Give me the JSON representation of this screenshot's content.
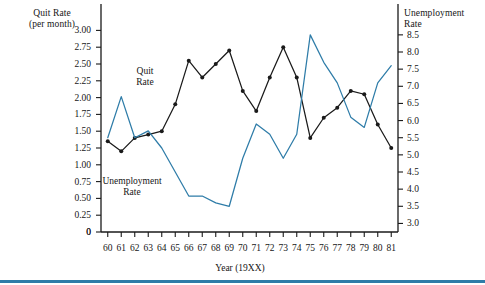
{
  "figure": {
    "left_axis_title": "Quit Rate\n(per month)",
    "right_axis_title": "Unemployment\nRate",
    "x_axis_title": "Year (19XX)",
    "quit_series_label": "Quit\nRate",
    "unemployment_series_label": "Unemployment\nRate",
    "zero_label": "0",
    "accent_color": "#2e7ca8",
    "quit_line_color": "#1a1a1a",
    "unemployment_line_color": "#2e7ca8",
    "bottom_rule_color": "#2e7ca8"
  },
  "chart_data": {
    "type": "line",
    "title": "",
    "xlabel": "Year (19XX)",
    "ylabel": "Quit Rate (per month)",
    "y2label": "Unemployment Rate",
    "grid": false,
    "legend": "inline-annotations",
    "x": [
      60,
      61,
      62,
      63,
      64,
      65,
      66,
      67,
      68,
      69,
      70,
      71,
      72,
      73,
      74,
      75,
      76,
      77,
      78,
      79,
      80,
      81
    ],
    "xticklabels": [
      "60",
      "61",
      "62",
      "63",
      "64",
      "65",
      "66",
      "67",
      "68",
      "69",
      "70",
      "71",
      "72",
      "73",
      "74",
      "75",
      "76",
      "77",
      "78",
      "79",
      "80",
      "81"
    ],
    "ylim": [
      0,
      3.125
    ],
    "yticks": [
      0,
      0.25,
      0.5,
      0.75,
      1.0,
      1.25,
      1.5,
      1.75,
      2.0,
      2.25,
      2.5,
      2.75,
      3.0
    ],
    "yticklabels": [
      "0",
      "0.25",
      "0.50",
      "0.75",
      "1.00",
      "1.25",
      "1.50",
      "1.75",
      "2.00",
      "2.25",
      "2.50",
      "2.75",
      "3.00"
    ],
    "y2lim": [
      2.75,
      8.875
    ],
    "y2ticks": [
      3.0,
      3.5,
      4.0,
      4.5,
      5.0,
      5.5,
      6.0,
      6.5,
      7.0,
      7.5,
      8.0,
      8.5
    ],
    "y2ticklabels": [
      "3.0",
      "3.5",
      "4.0",
      "4.5",
      "5.0",
      "5.5",
      "6.0",
      "6.5",
      "7.0",
      "7.5",
      "8.0",
      "8.5"
    ],
    "series": [
      {
        "name": "Quit Rate",
        "axis": "left",
        "color": "#1a1a1a",
        "markers": true,
        "values": [
          1.35,
          1.2,
          1.4,
          1.45,
          1.5,
          1.9,
          2.55,
          2.3,
          2.5,
          2.7,
          2.1,
          1.8,
          2.3,
          2.75,
          2.3,
          1.4,
          1.7,
          1.85,
          2.1,
          2.05,
          1.6,
          1.25
        ]
      },
      {
        "name": "Unemployment Rate",
        "axis": "right",
        "color": "#2e7ca8",
        "markers": false,
        "values": [
          5.5,
          6.7,
          5.5,
          5.7,
          5.2,
          4.5,
          3.8,
          3.8,
          3.6,
          3.5,
          4.9,
          5.9,
          5.6,
          4.9,
          5.6,
          8.5,
          7.7,
          7.1,
          6.1,
          5.8,
          7.1,
          7.6
        ]
      }
    ]
  }
}
